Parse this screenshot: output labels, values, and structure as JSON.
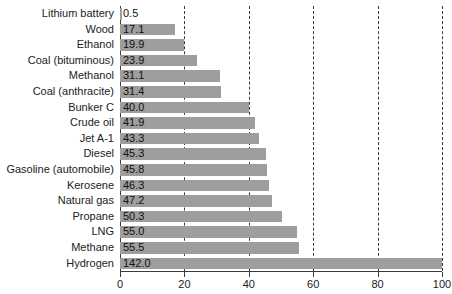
{
  "chart_data": {
    "type": "bar",
    "orientation": "horizontal",
    "title": "",
    "subtitle": "",
    "xlabel": "",
    "ylabel": "",
    "xlim": [
      0,
      100
    ],
    "xticks": [
      0,
      20,
      40,
      60,
      80,
      100
    ],
    "xtick_labels": [
      "0",
      "20",
      "40",
      "60",
      "80",
      "100"
    ],
    "grid": true,
    "grid_axis": "x",
    "grid_style": "dashed",
    "legend": false,
    "bar_color": "#9e9e9e",
    "axis_color": "#3a3a3a",
    "text_color": "#222222",
    "value_label_position": "inside-left",
    "note": "Hydrogen bar value 142.0 exceeds axis maximum and is clipped at 100",
    "categories": [
      "Lithium battery",
      "Wood",
      "Ethanol",
      "Coal (bituminous)",
      "Methanol",
      "Coal (anthracite)",
      "Bunker C",
      "Crude oil",
      "Jet A-1",
      "Diesel",
      "Gasoline (automobile)",
      "Kerosene",
      "Natural gas",
      "Propane",
      "LNG",
      "Methane",
      "Hydrogen"
    ],
    "values": [
      0.5,
      17.1,
      19.9,
      23.9,
      31.1,
      31.4,
      40.0,
      41.9,
      43.3,
      45.3,
      45.8,
      46.3,
      47.2,
      50.3,
      55.0,
      55.5,
      142.0
    ],
    "value_labels": [
      "0.5",
      "17.1",
      "19.9",
      "23.9",
      "31.1",
      "31.4",
      "40.0",
      "41.9",
      "43.3",
      "45.3",
      "45.8",
      "46.3",
      "47.2",
      "50.3",
      "55.0",
      "55.5",
      "142.0"
    ]
  }
}
